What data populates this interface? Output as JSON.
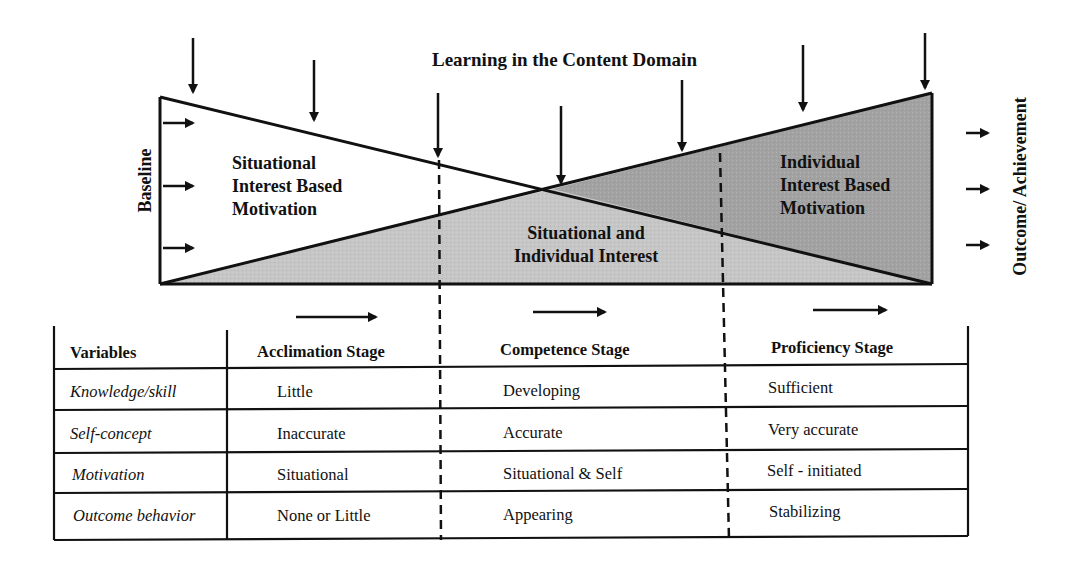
{
  "diagram": {
    "title": "Learning in the Content Domain",
    "left_axis_label": "Baseline",
    "right_axis_label": "Outcome/ Achievement",
    "regions": {
      "situational": [
        "Situational",
        "Interest Based",
        "Motivation"
      ],
      "mixed": [
        "Situational and",
        "Individual Interest"
      ],
      "individual": [
        "Individual",
        "Interest Based",
        "Motivation"
      ]
    },
    "colors": {
      "line": "#111111",
      "mixed_fill": "#c4c4c4",
      "individual_fill": "#a3a3a3",
      "background": "#ffffff"
    }
  },
  "table": {
    "headers": [
      "Variables",
      "Acclimation Stage",
      "Competence Stage",
      "Proficiency Stage"
    ],
    "rows": [
      {
        "variable": "Knowledge/skill",
        "acclimation": "Little",
        "competence": "Developing",
        "proficiency": "Sufficient"
      },
      {
        "variable": "Self-concept",
        "acclimation": "Inaccurate",
        "competence": "Accurate",
        "proficiency": "Very accurate"
      },
      {
        "variable": "Motivation",
        "acclimation": "Situational",
        "competence": "Situational & Self",
        "proficiency": "Self - initiated"
      },
      {
        "variable": "Outcome behavior",
        "acclimation": "None or Little",
        "competence": "Appearing",
        "proficiency": "Stabilizing"
      }
    ]
  }
}
